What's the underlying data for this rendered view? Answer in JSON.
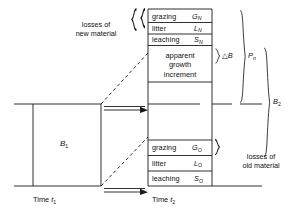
{
  "diagram": {
    "axis": {
      "left_time_label": "Time",
      "left_time_sym": "t",
      "left_time_sub": "1",
      "right_time_label": "Time",
      "right_time_sym": "t",
      "right_time_sub": "2"
    },
    "left_block": {
      "symbol": "B",
      "subscript": "1"
    },
    "new_losses": {
      "group_label_line1": "losses of",
      "group_label_line2": "new material",
      "rows": [
        {
          "name": "grazing",
          "symbol": "G",
          "subscript": "N"
        },
        {
          "name": "litter",
          "symbol": "L",
          "subscript": "N"
        },
        {
          "name": "leaching",
          "symbol": "S",
          "subscript": "N"
        }
      ]
    },
    "growth_block": {
      "line1": "apparent",
      "line2": "growth",
      "line3": "increment"
    },
    "old_losses": {
      "group_label_line1": "losses of",
      "group_label_line2": "old material",
      "rows": [
        {
          "name": "grazing",
          "symbol": "G",
          "subscript": "O"
        },
        {
          "name": "litter",
          "symbol": "L",
          "subscript": "O"
        },
        {
          "name": "leaching",
          "symbol": "S",
          "subscript": "O"
        }
      ]
    },
    "brackets": {
      "delta_b": "△B",
      "pn_symbol": "P",
      "pn_subscript": "n",
      "b2_symbol": "B",
      "b2_subscript": "2"
    },
    "colors": {
      "line": "#1a1a1a",
      "background": "#ffffff",
      "text": "#111111"
    }
  }
}
